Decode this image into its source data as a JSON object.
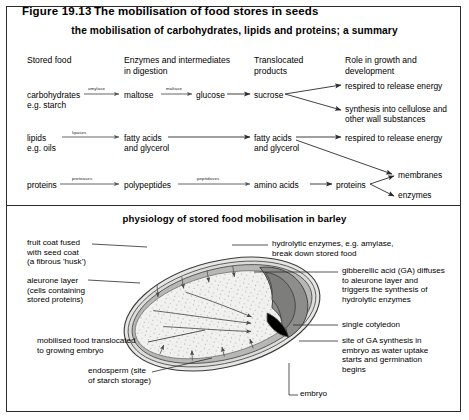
{
  "figure": {
    "number": "Figure 19.13",
    "title": "The mobilisation of food stores in seeds",
    "subtitle": "the mobilisation of carbohydrates, lipids and proteins; a summary",
    "panel2_title": "physiology of stored food mobilisation in barley"
  },
  "columns": [
    {
      "label": "Stored food"
    },
    {
      "label": "Enzymes and intermediates\nin digestion"
    },
    {
      "label": "Translocated\nproducts"
    },
    {
      "label": "Role in growth and\ndevelopment"
    }
  ],
  "pathways": {
    "carbohydrate": {
      "source": "carbohydrates\ne.g. starch",
      "enzyme1": "amylase",
      "intermediate1": "maltose",
      "enzyme2": "maltase",
      "intermediate2": "glucose",
      "translocated": "sucrose",
      "role1": "respired to release energy",
      "role2": "synthesis into cellulose and\nother wall substances"
    },
    "lipid": {
      "source": "lipids\ne.g. oils",
      "enzyme1": "lipases",
      "intermediate1": "fatty acids\nand glycerol",
      "translocated": "fatty acids\nand glycerol",
      "role1": "respired to release energy"
    },
    "protein": {
      "source": "proteins",
      "enzyme1": "proteases",
      "intermediate1": "polypeptides",
      "enzyme2": "peptidases",
      "intermediate2": "amino acids",
      "translocated": "proteins",
      "role1": "membranes",
      "role2": "enzymes"
    }
  },
  "seed_labels": {
    "fruit_coat": "fruit coat fused\nwith seed coat\n(a fibrous 'husk')",
    "aleurone": "aleurone layer\n(cells containing\nstored proteins)",
    "mobilised": "mobilised food translocated\nto growing embryo",
    "endosperm": "endosperm (site\nof starch storage)",
    "hydrolytic": "hydrolytic enzymes, e.g. amylase,\nbreak down stored food",
    "gibberellic": "gibberellic acid (GA) diffuses\nto aleurone layer and\ntriggers the synthesis of\nhydrolytic enzymes",
    "cotyledon": "single cotyledon",
    "ga_synthesis": "site of GA synthesis in\nembryo as water uptake\nstarts and germination\nbegins",
    "embryo": "embryo"
  },
  "colors": {
    "ink": "#2b2b2b",
    "endosperm_fill": "#f0f0ee",
    "aleurone_fill": "#b9b9b7",
    "embryo_fill": "#8d8d8b",
    "husk_fill": "#e3e3e1"
  }
}
